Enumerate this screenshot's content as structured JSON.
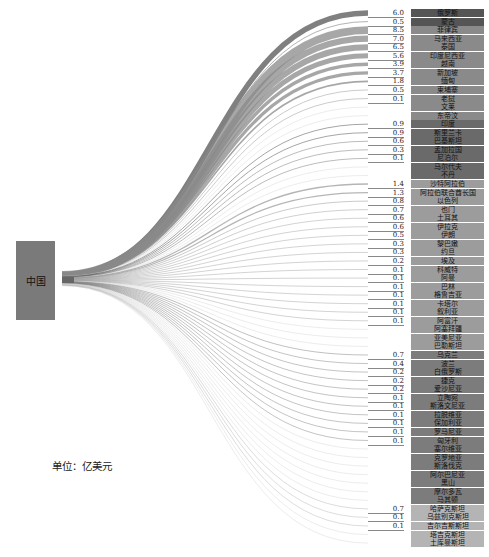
{
  "chart_data": {
    "type": "sankey",
    "title": "",
    "unit_label": "单位：亿美元",
    "source": "中国",
    "targets": [
      {
        "name": "俄罗斯",
        "value": 6.0
      },
      {
        "name": "蒙古",
        "value": 0.5
      },
      {
        "name": "菲律宾",
        "value": 8.5
      },
      {
        "name": "马来西亚",
        "value": 7.0
      },
      {
        "name": "泰国",
        "value": 6.5
      },
      {
        "name": "印度尼西亚",
        "value": 5.6
      },
      {
        "name": "越南",
        "value": 3.9
      },
      {
        "name": "新加坡",
        "value": 3.7
      },
      {
        "name": "缅甸",
        "value": 1.8
      },
      {
        "name": "柬埔寨",
        "value": 0.5
      },
      {
        "name": "老挝",
        "value": 0.1
      },
      {
        "name": "文莱",
        "value": null
      },
      {
        "name": "东帝汶",
        "value": null
      },
      {
        "name": "印度",
        "value": 0.9
      },
      {
        "name": "斯里兰卡",
        "value": 0.9
      },
      {
        "name": "巴基斯坦",
        "value": 0.6
      },
      {
        "name": "孟加拉国",
        "value": 0.3
      },
      {
        "name": "尼泊尔",
        "value": 0.1
      },
      {
        "name": "马尔代夫",
        "value": null
      },
      {
        "name": "不丹",
        "value": null
      },
      {
        "name": "沙特阿拉伯",
        "value": 1.4
      },
      {
        "name": "阿拉伯联合酋长国",
        "value": 1.3
      },
      {
        "name": "以色列",
        "value": 0.8
      },
      {
        "name": "也门",
        "value": 0.7
      },
      {
        "name": "土耳其",
        "value": 0.6
      },
      {
        "name": "伊拉克",
        "value": 0.6
      },
      {
        "name": "伊朗",
        "value": 0.5
      },
      {
        "name": "黎巴嫩",
        "value": 0.3
      },
      {
        "name": "约旦",
        "value": 0.3
      },
      {
        "name": "埃及",
        "value": 0.2
      },
      {
        "name": "科威特",
        "value": 0.1
      },
      {
        "name": "阿曼",
        "value": 0.1
      },
      {
        "name": "巴林",
        "value": 0.1
      },
      {
        "name": "格鲁吉亚",
        "value": 0.1
      },
      {
        "name": "卡塔尔",
        "value": 0.1
      },
      {
        "name": "叙利亚",
        "value": 0.1
      },
      {
        "name": "阿富汗",
        "value": 0.1
      },
      {
        "name": "阿塞拜疆",
        "value": null
      },
      {
        "name": "亚美尼亚",
        "value": null
      },
      {
        "name": "巴勒斯坦",
        "value": null
      },
      {
        "name": "乌克兰",
        "value": 0.7
      },
      {
        "name": "波兰",
        "value": 0.4
      },
      {
        "name": "白俄罗斯",
        "value": 0.2
      },
      {
        "name": "捷克",
        "value": 0.2
      },
      {
        "name": "爱沙尼亚",
        "value": 0.2
      },
      {
        "name": "立陶宛",
        "value": 0.1
      },
      {
        "name": "斯洛文尼亚",
        "value": 0.1
      },
      {
        "name": "拉脱维亚",
        "value": 0.1
      },
      {
        "name": "保加利亚",
        "value": 0.1
      },
      {
        "name": "罗马尼亚",
        "value": 0.1
      },
      {
        "name": "匈牙利",
        "value": 0.1
      },
      {
        "name": "塞尔维亚",
        "value": null
      },
      {
        "name": "克罗地亚",
        "value": null
      },
      {
        "name": "斯洛伐克",
        "value": null
      },
      {
        "name": "阿尔巴尼亚",
        "value": null
      },
      {
        "name": "黑山",
        "value": null
      },
      {
        "name": "摩尔多瓦",
        "value": null
      },
      {
        "name": "马其顿",
        "value": null
      },
      {
        "name": "哈萨克斯坦",
        "value": 0.7
      },
      {
        "name": "乌兹别克斯坦",
        "value": 0.1
      },
      {
        "name": "吉尔吉斯斯坦",
        "value": 0.1
      },
      {
        "name": "塔吉克斯坦",
        "value": null
      },
      {
        "name": "土库曼斯坦",
        "value": null
      }
    ],
    "groups": [
      {
        "name": "Russia-Mongolia",
        "from": 0,
        "to": 1,
        "color": "#555555"
      },
      {
        "name": "Southeast Asia",
        "from": 2,
        "to": 12,
        "color": "#8a8a8a"
      },
      {
        "name": "South Asia",
        "from": 13,
        "to": 19,
        "color": "#6a6a6a"
      },
      {
        "name": "West Asia & North Africa",
        "from": 20,
        "to": 39,
        "color": "#9c9c9c"
      },
      {
        "name": "Central & Eastern Europe",
        "from": 40,
        "to": 57,
        "color": "#7c7c7c"
      },
      {
        "name": "Central Asia",
        "from": 58,
        "to": 62,
        "color": "#b4b4b4"
      }
    ],
    "layout": {
      "row_top": 13,
      "row_pitch": 8.55,
      "source_x": 62,
      "source_y": 280,
      "target_x": 368
    }
  }
}
